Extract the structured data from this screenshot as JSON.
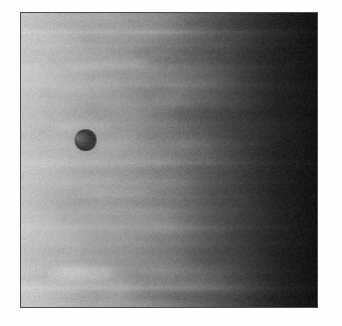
{
  "page": {
    "background_color": "#fefefe",
    "width": 342,
    "height": 326
  },
  "photo": {
    "alt_text": "Grayscale close-up of banded gas-giant cloud tops with a small dark round moon disc at left of center",
    "frame": {
      "border_color": "#4a4a4a",
      "border_width_px": 1,
      "left_px": 20,
      "top_px": 12,
      "width_px": 298,
      "height_px": 296
    },
    "palette": {
      "brightest": "#c9c9c9",
      "light_band": "#b4b4b4",
      "mid_tone": "#8e8e8e",
      "shadow_tone": "#5a5a5a",
      "limb_dark": "#2f2f2f",
      "darkest": "#232323",
      "moon_dark": "#3a3a3a",
      "moon_crescent": "#6f6f6f",
      "moon_halo": "#9a9a9a"
    },
    "lighting": {
      "description": "limb darkening, bright at left, falling to dark at right edge",
      "gradient_stops_pct": [
        0,
        18,
        38,
        55,
        72,
        86,
        100
      ],
      "gradient_values": [
        "#bdbdbd",
        "#b2b2b2",
        "#9c9c9c",
        "#7f7f7f",
        "#5c5c5c",
        "#3c3c3c",
        "#272727"
      ]
    },
    "moon": {
      "label": "transiting-moon-disc",
      "center_x_px": 85,
      "center_y_px": 140,
      "radius_px": 11,
      "shading": "dark right limb with faint lighter crescent on left"
    },
    "bands": [
      {
        "name": "north-temperate-zone",
        "top_pct": 2,
        "height_pct": 9,
        "tone": "#c0c0c0",
        "opacity": 0.3
      },
      {
        "name": "north-temperate-belt",
        "top_pct": 11,
        "height_pct": 7,
        "tone": "#6d6d6d",
        "opacity": 0.26
      },
      {
        "name": "north-tropical-zone",
        "top_pct": 19,
        "height_pct": 11,
        "tone": "#b9b9b9",
        "opacity": 0.22
      },
      {
        "name": "north-equatorial-belt",
        "top_pct": 31,
        "height_pct": 13,
        "tone": "#6a6a6a",
        "opacity": 0.3
      },
      {
        "name": "equatorial-zone",
        "top_pct": 45,
        "height_pct": 12,
        "tone": "#bcbcbc",
        "opacity": 0.24
      },
      {
        "name": "equatorial-festoons",
        "top_pct": 58,
        "height_pct": 9,
        "tone": "#707070",
        "opacity": 0.26
      },
      {
        "name": "south-tropical-zone",
        "top_pct": 68,
        "height_pct": 10,
        "tone": "#b6b6b6",
        "opacity": 0.22
      },
      {
        "name": "south-equatorial-belt",
        "top_pct": 79,
        "height_pct": 8,
        "tone": "#6b6b6b",
        "opacity": 0.24
      },
      {
        "name": "south-bright-zone",
        "top_pct": 88,
        "height_pct": 11,
        "tone": "#c6c6c6",
        "opacity": 0.32
      }
    ],
    "wisps": [
      {
        "name": "festoon-streak-upper",
        "x_pct": 4,
        "y_pct": 16,
        "w_pct": 52,
        "h_pct": 3.0,
        "tone": "#d0d0d0",
        "opacity": 0.22,
        "rot_deg": -2.5
      },
      {
        "name": "festoon-streak-upper2",
        "x_pct": 10,
        "y_pct": 24,
        "w_pct": 46,
        "h_pct": 2.2,
        "tone": "#606060",
        "opacity": 0.2,
        "rot_deg": 1.6
      },
      {
        "name": "turbulent-swirl-left",
        "x_pct": 2,
        "y_pct": 37,
        "w_pct": 38,
        "h_pct": 3.4,
        "tone": "#d2d2d2",
        "opacity": 0.2,
        "rot_deg": -1.2
      },
      {
        "name": "belt-filament-mid",
        "x_pct": 14,
        "y_pct": 52,
        "w_pct": 58,
        "h_pct": 2.0,
        "tone": "#5e5e5e",
        "opacity": 0.22,
        "rot_deg": -1.8
      },
      {
        "name": "belt-filament-mid2",
        "x_pct": 6,
        "y_pct": 60,
        "w_pct": 50,
        "h_pct": 2.6,
        "tone": "#cfcfcf",
        "opacity": 0.18,
        "rot_deg": 1.1
      },
      {
        "name": "festoon-streak-lower",
        "x_pct": 3,
        "y_pct": 72,
        "w_pct": 44,
        "h_pct": 3.0,
        "tone": "#666666",
        "opacity": 0.2,
        "rot_deg": -1.0
      },
      {
        "name": "bright-plume-bottom",
        "x_pct": 1,
        "y_pct": 86,
        "w_pct": 40,
        "h_pct": 5.0,
        "tone": "#dadada",
        "opacity": 0.3,
        "rot_deg": -1.5
      },
      {
        "name": "dark-edge-bottom",
        "x_pct": 18,
        "y_pct": 94,
        "w_pct": 54,
        "h_pct": 3.0,
        "tone": "#5a5a5a",
        "opacity": 0.2,
        "rot_deg": 0.8
      }
    ]
  }
}
